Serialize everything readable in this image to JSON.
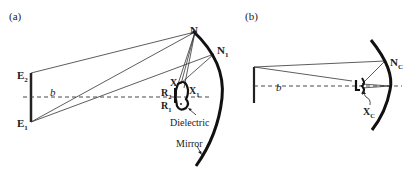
{
  "panels": [
    {
      "id": "a",
      "label": "(a)",
      "points": {
        "N": "N",
        "N1_main": "N",
        "N1_sub": "1",
        "E2_main": "E",
        "E2_sub": "2",
        "E1_main": "E",
        "E1_sub": "1",
        "X": "X",
        "X1_main": "X",
        "X1_sub": "1",
        "R2_main": "R",
        "R2_sub": "2",
        "R1_main": "R",
        "R1_sub": "1"
      },
      "axis_label": "b",
      "annotations": {
        "dielectric": "Dielectric",
        "mirror": "Mirror"
      }
    },
    {
      "id": "b",
      "label": "(b)",
      "points": {
        "NC_main": "N",
        "NC_sub": "C",
        "XC_main": "X",
        "XC_sub": "C"
      },
      "axis_label": "b"
    }
  ],
  "colors": {
    "ink": "#222222",
    "background": "#ffffff"
  }
}
